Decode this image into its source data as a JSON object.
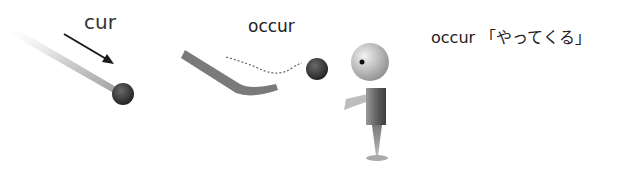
{
  "panels": [
    {
      "label": "cur"
    },
    {
      "label": "occur"
    },
    {
      "label": "occur",
      "meaning": "「やってくる」"
    }
  ],
  "colors": {
    "ball": "#2e2e2e",
    "trail": "#b8b8b8",
    "text": "#222222"
  }
}
